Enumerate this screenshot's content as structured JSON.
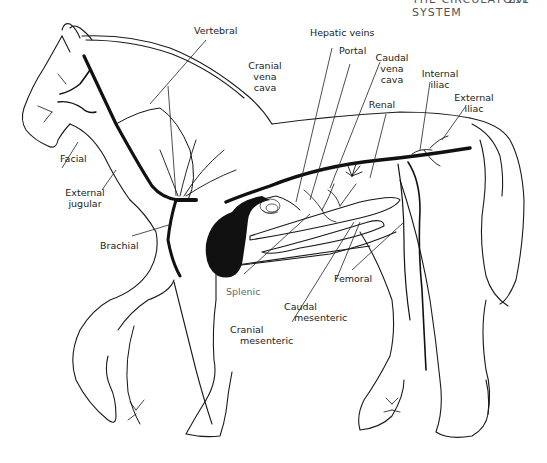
{
  "header": {
    "title": "THE CIRCULATORY SYSTEM",
    "page_number": "291"
  },
  "diagram": {
    "colors": {
      "ink": "#1a1a1a",
      "vessel": "#111111",
      "background": "#ffffff"
    }
  },
  "labels": {
    "vertebral": [
      "Vertebral"
    ],
    "hepatic_veins": [
      "Hepatic veins"
    ],
    "portal": [
      "Portal"
    ],
    "cranial_vena_cava": [
      "Cranial",
      "vena",
      "cava"
    ],
    "caudal_vena_cava": [
      "Caudal",
      "vena",
      "cava"
    ],
    "internal_iliac": [
      "Internal",
      "iliac"
    ],
    "external_iliac": [
      "External",
      "iliac"
    ],
    "renal": [
      "Renal"
    ],
    "facial": [
      "Facial"
    ],
    "external_jugular": [
      "External",
      "jugular"
    ],
    "brachial": [
      "Brachial"
    ],
    "splenic": [
      "Splenic"
    ],
    "femoral": [
      "Femoral"
    ],
    "caudal_mesenteric": [
      "Caudal",
      "mesenteric"
    ],
    "cranial_mesenteric": [
      "Cranial",
      "mesenteric"
    ]
  }
}
